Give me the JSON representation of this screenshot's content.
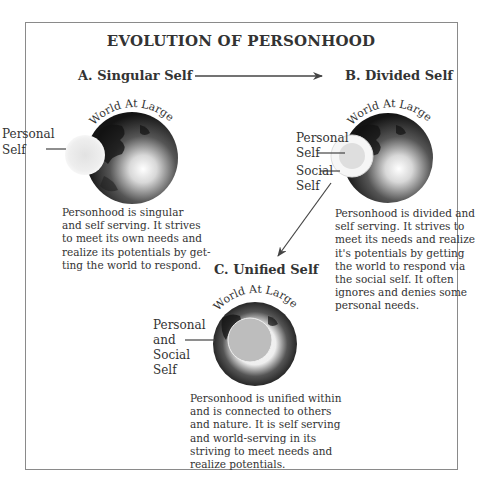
{
  "title": "EVOLUTION OF PERSONHOOD",
  "stages": {
    "a": {
      "heading": "A. Singular Self",
      "arc_label": "World At Large",
      "self_label_1": "Personal",
      "self_label_2": "Self",
      "description": [
        "Personhood is singular",
        "and self serving.  It strives",
        "to meet its own needs and",
        "realize its potentials by get-",
        "ting the world to respond."
      ]
    },
    "b": {
      "heading": "B.  Divided Self",
      "arc_label": "World At Large",
      "personal_label_1": "Personal",
      "personal_label_2": "Self",
      "social_label_1": "Social",
      "social_label_2": "Self",
      "description": [
        "Personhood is divided and",
        "self serving.  It strives to",
        "meet its needs and realize",
        "it's potentials by getting",
        "the world to respond via",
        "the social self.  It often",
        "ignores and denies some",
        "personal  needs."
      ]
    },
    "c": {
      "heading": "C. Unified Self",
      "arc_label": "World At Large",
      "self_label_1": "Personal",
      "self_label_2": "and",
      "self_label_3": "Social",
      "self_label_4": "Self",
      "description": [
        "Personhood is unified within",
        "and is connected to others",
        "and nature.  It is self serving",
        "and world-serving in its",
        "striving to meet needs and",
        "realize potentials."
      ]
    }
  },
  "colors": {
    "globe_dark": "#1a1a1a",
    "globe_light": "#ffffff",
    "self_fill": "#e6e6e6",
    "unified_fill": "#bdbdbd",
    "line": "#444444",
    "frame": "#8a8a8a"
  }
}
